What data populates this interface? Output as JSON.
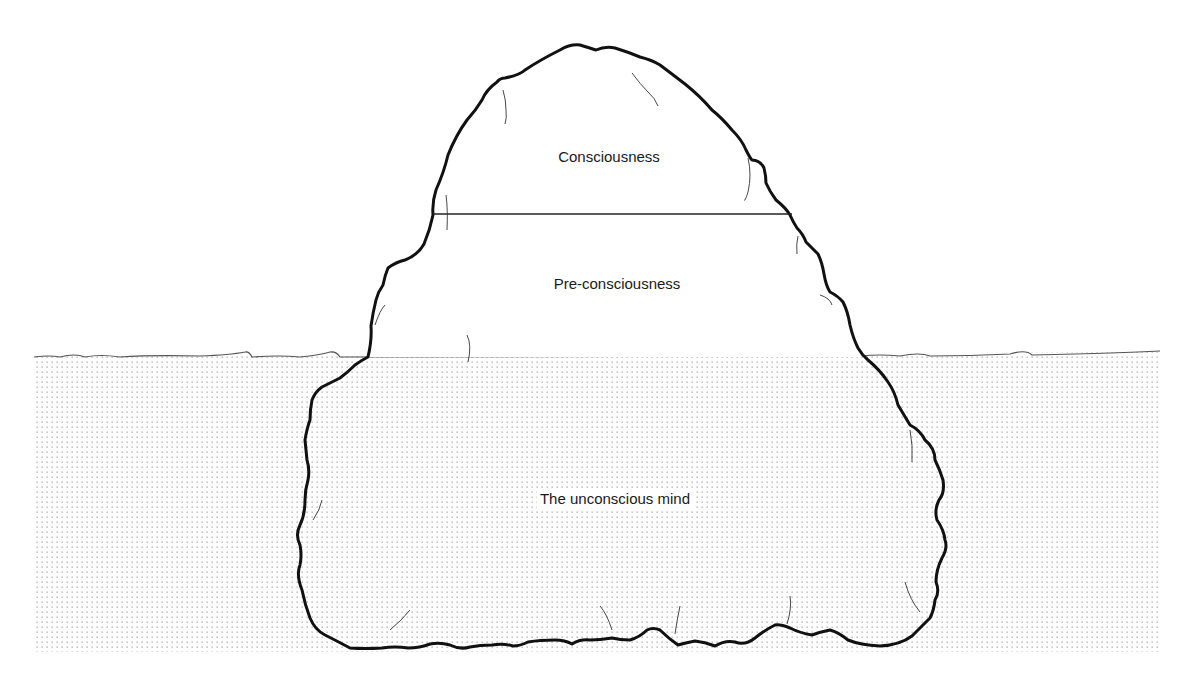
{
  "diagram": {
    "layers": [
      {
        "id": "consciousness",
        "label": "Consciousness",
        "x": 609,
        "y": 148
      },
      {
        "id": "pre-consciousness",
        "label": "Pre-consciousness",
        "x": 617,
        "y": 275
      },
      {
        "id": "unconscious",
        "label": "The unconscious mind",
        "x": 615,
        "y": 490
      }
    ],
    "colors": {
      "outline": "#111111",
      "water_dots": "#9a9a9a",
      "waterline": "#555555",
      "background": "#ffffff"
    }
  }
}
